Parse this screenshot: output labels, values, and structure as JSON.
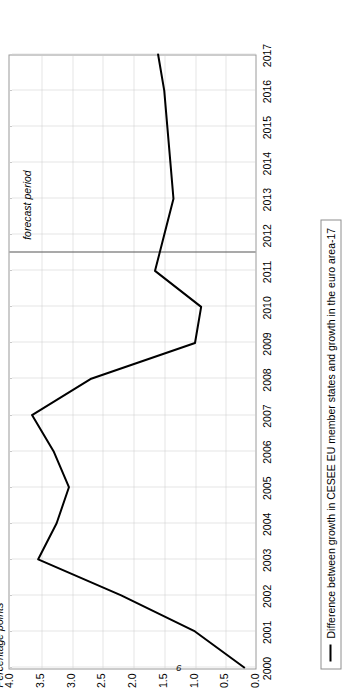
{
  "page": {
    "number": "6",
    "rotation_degrees": -90
  },
  "chart_data": {
    "type": "line",
    "title": "",
    "subtitle": "",
    "xlabel": "",
    "ylabel": "Percentage points",
    "ylim": [
      0.0,
      4.0
    ],
    "ytick_labels": [
      "0.0",
      "0.5",
      "1.0",
      "1.5",
      "2.0",
      "2.5",
      "3.0",
      "3.5",
      "4.0"
    ],
    "ytick_values": [
      0.0,
      0.5,
      1.0,
      1.5,
      2.0,
      2.5,
      3.0,
      3.5,
      4.0
    ],
    "grid": true,
    "legend_position": "bottom-left",
    "categories": [
      "2000",
      "2001",
      "2002",
      "2003",
      "2004",
      "2005",
      "2006",
      "2007",
      "2008",
      "2009",
      "2010",
      "2011",
      "2012",
      "2013",
      "2014",
      "2015",
      "2016",
      "2017"
    ],
    "x": [
      2000,
      2001,
      2002,
      2003,
      2004,
      2005,
      2006,
      2007,
      2008,
      2009,
      2010,
      2011,
      2012,
      2013,
      2014,
      2015,
      2016,
      2017
    ],
    "series": [
      {
        "name": "Difference between growth in CESEE EU member states and growth in the euro area-17",
        "color": "#000000",
        "values": [
          0.2,
          1.0,
          2.2,
          3.55,
          3.25,
          3.05,
          3.3,
          3.65,
          2.7,
          1.0,
          0.9,
          1.65,
          1.5,
          1.35,
          1.4,
          1.45,
          1.5,
          1.6
        ]
      }
    ],
    "annotations": [
      {
        "text": "forecast period",
        "type": "region-label",
        "x_start": 2011.5,
        "x_end": 2017
      }
    ],
    "vertical_markers": [
      {
        "name": "forecast-divider",
        "x": 2011.5,
        "color": "#555555"
      }
    ]
  },
  "legend": {
    "entries": [
      {
        "label": "Difference between growth in CESEE EU member states and growth in the euro area-17",
        "marker": "line"
      }
    ]
  },
  "axes": {
    "y_title": "Percentage points",
    "x_ticks": [
      "2000",
      "2001",
      "2002",
      "2003",
      "2004",
      "2005",
      "2006",
      "2007",
      "2008",
      "2009",
      "2010",
      "2011",
      "2012",
      "2013",
      "2014",
      "2015",
      "2016",
      "2017"
    ],
    "y_ticks": [
      "4.0",
      "3.5",
      "3.0",
      "2.5",
      "2.0",
      "1.5",
      "1.0",
      "0.5",
      "0.0"
    ]
  }
}
